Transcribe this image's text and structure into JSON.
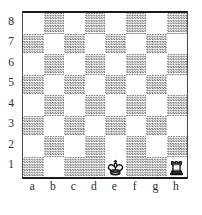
{
  "diagram": {
    "kind": "chess-board-diagram",
    "orientation": "white-bottom",
    "board_size": 8,
    "light_square_color": "#ffffff",
    "dark_square_color": "#7d7d7d",
    "border_color": "#1a1a1a",
    "label_color": "#2b2b2b"
  },
  "labels": {
    "ranks": [
      "8",
      "7",
      "6",
      "5",
      "4",
      "3",
      "2",
      "1"
    ],
    "files": [
      "a",
      "b",
      "c",
      "d",
      "e",
      "f",
      "g",
      "h"
    ]
  },
  "position": {
    "fen": "8/8/8/8/8/8/8/4K2R",
    "pieces": [
      {
        "square": "e1",
        "color": "white",
        "type": "king",
        "icon": "white-king-icon",
        "symbol": "K"
      },
      {
        "square": "h1",
        "color": "white",
        "type": "rook",
        "icon": "white-rook-icon",
        "symbol": "R"
      }
    ]
  },
  "squares": {
    "rank8": [
      "light",
      "dark",
      "light",
      "dark",
      "light",
      "dark",
      "light",
      "dark"
    ],
    "rank7": [
      "dark",
      "light",
      "dark",
      "light",
      "dark",
      "light",
      "dark",
      "light"
    ],
    "rank6": [
      "light",
      "dark",
      "light",
      "dark",
      "light",
      "dark",
      "light",
      "dark"
    ],
    "rank5": [
      "dark",
      "light",
      "dark",
      "light",
      "dark",
      "light",
      "dark",
      "light"
    ],
    "rank4": [
      "light",
      "dark",
      "light",
      "dark",
      "light",
      "dark",
      "light",
      "dark"
    ],
    "rank3": [
      "dark",
      "light",
      "dark",
      "light",
      "dark",
      "light",
      "dark",
      "light"
    ],
    "rank2": [
      "light",
      "dark",
      "light",
      "dark",
      "light",
      "dark",
      "light",
      "dark"
    ],
    "rank1": [
      "dark",
      "light",
      "dark",
      "light",
      "light",
      "dark",
      "dark",
      "light"
    ]
  }
}
